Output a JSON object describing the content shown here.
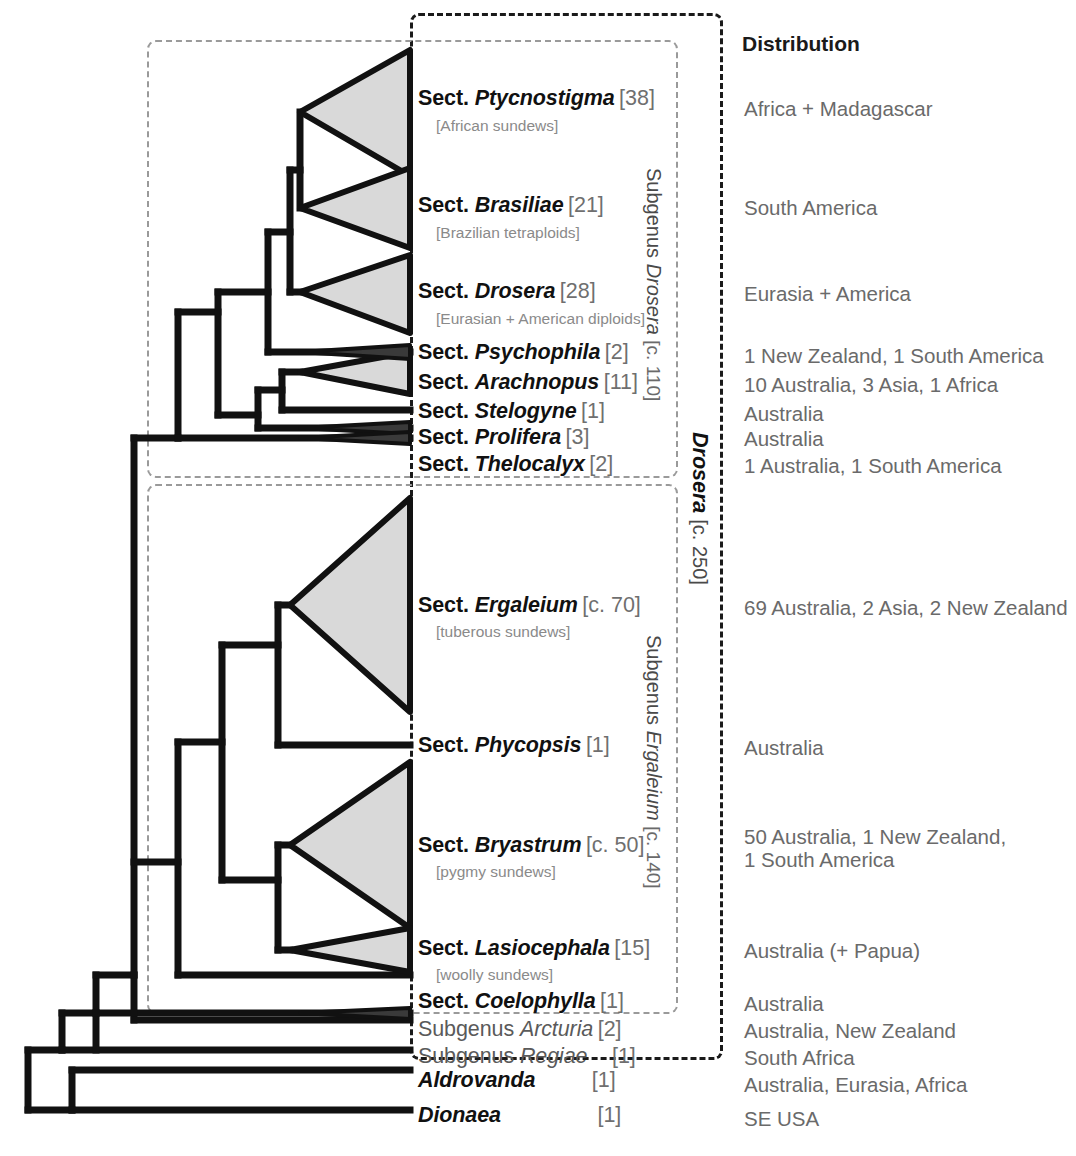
{
  "figure": {
    "type": "cladogram",
    "organism": "Drosera (sundews) and relatives",
    "distribution_header": "Distribution"
  },
  "taxa": [
    {
      "prefix": "Sect.",
      "name": "Ptycnostigma",
      "count": "[38]",
      "common": "[African sundews]",
      "distribution": "Africa + Madagascar",
      "style": "bold",
      "shape": "triangle-large"
    },
    {
      "prefix": "Sect.",
      "name": "Brasiliae",
      "count": "[21]",
      "common": "[Brazilian tetraploids]",
      "distribution": "South America",
      "style": "bold",
      "shape": "triangle-medium"
    },
    {
      "prefix": "Sect.",
      "name": "Drosera",
      "count": "[28]",
      "common": "[Eurasian + American diploids]",
      "distribution": "Eurasia + America",
      "style": "bold",
      "shape": "triangle-large"
    },
    {
      "prefix": "Sect.",
      "name": "Psychophila",
      "count": "[2]",
      "common": "",
      "distribution": "1 New Zealand, 1 South America",
      "style": "bold",
      "shape": "sliver"
    },
    {
      "prefix": "Sect.",
      "name": "Arachnopus",
      "count": "[11]",
      "common": "",
      "distribution": "10 Australia, 3 Asia, 1 Africa",
      "style": "bold",
      "shape": "triangle-small"
    },
    {
      "prefix": "Sect.",
      "name": "Stelogyne",
      "count": "[1]",
      "common": "",
      "distribution": "Australia",
      "style": "bold",
      "shape": "line"
    },
    {
      "prefix": "Sect.",
      "name": "Prolifera",
      "count": "[3]",
      "common": "",
      "distribution": "Australia",
      "style": "bold",
      "shape": "sliver"
    },
    {
      "prefix": "Sect.",
      "name": "Thelocalyx",
      "count": "[2]",
      "common": "",
      "distribution": "1 Australia, 1 South America",
      "style": "bold",
      "shape": "sliver"
    },
    {
      "prefix": "Sect.",
      "name": "Ergaleium",
      "count": "[c. 70]",
      "common": "[tuberous sundews]",
      "distribution": "69 Australia, 2 Asia, 2 New Zealand",
      "style": "bold",
      "shape": "triangle-xlarge"
    },
    {
      "prefix": "Sect.",
      "name": "Phycopsis",
      "count": "[1]",
      "common": "",
      "distribution": "Australia",
      "style": "bold",
      "shape": "line"
    },
    {
      "prefix": "Sect.",
      "name": "Bryastrum",
      "count": "[c. 50]",
      "common": "[pygmy sundews]",
      "distribution": "50 Australia, 1 New Zealand,\n1 South America",
      "style": "bold",
      "shape": "triangle-xlarge"
    },
    {
      "prefix": "Sect.",
      "name": "Lasiocephala",
      "count": "[15]",
      "common": "[woolly sundews]",
      "distribution": "Australia (+ Papua)",
      "style": "bold",
      "shape": "triangle-small"
    },
    {
      "prefix": "Sect.",
      "name": "Coelophylla",
      "count": "[1]",
      "common": "",
      "distribution": "Australia",
      "style": "bold",
      "shape": "line"
    },
    {
      "prefix": "Subgenus",
      "name": "Arcturia",
      "count": "[2]",
      "common": "",
      "distribution": "Australia, New Zealand",
      "style": "light",
      "shape": "sliver"
    },
    {
      "prefix": "Subgenus",
      "name": "Regiae",
      "count": "[1]",
      "common": "",
      "distribution": "South Africa",
      "style": "light",
      "shape": "line"
    },
    {
      "prefix": "",
      "name": "Aldrovanda",
      "count": "[1]",
      "common": "",
      "distribution": "Australia, Eurasia, Africa",
      "style": "bold",
      "shape": "line"
    },
    {
      "prefix": "",
      "name": "Dionaea",
      "count": "[1]",
      "common": "",
      "distribution": "SE USA",
      "style": "bold",
      "shape": "line"
    }
  ],
  "brackets": [
    {
      "label_prefix": "Subgenus",
      "label_name": "Drosera",
      "label_count": "[c. 110]",
      "style": "gray"
    },
    {
      "label_prefix": "",
      "label_name": "Drosera",
      "label_count": "[c. 250]",
      "style": "black"
    },
    {
      "label_prefix": "Subgenus",
      "label_name": "Ergaleium",
      "label_count": "[c. 140]",
      "style": "gray"
    }
  ],
  "colors": {
    "line": "#111111",
    "triangle_fill": "#d9d9d9",
    "dashed_gray": "#9a9a9a",
    "dashed_black": "#1a1a1a",
    "text_primary": "#111111",
    "text_secondary": "#6a6a6a",
    "text_tertiary": "#8a8a8a"
  }
}
